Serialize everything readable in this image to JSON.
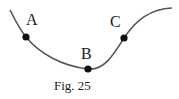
{
  "figure": {
    "caption": "Fig. 25",
    "points": [
      {
        "label": "A",
        "x": 26,
        "y": 37
      },
      {
        "label": "B",
        "x": 88,
        "y": 69
      },
      {
        "label": "C",
        "x": 124,
        "y": 38
      }
    ],
    "curve_color": "#555555",
    "point_color": "#111111"
  }
}
